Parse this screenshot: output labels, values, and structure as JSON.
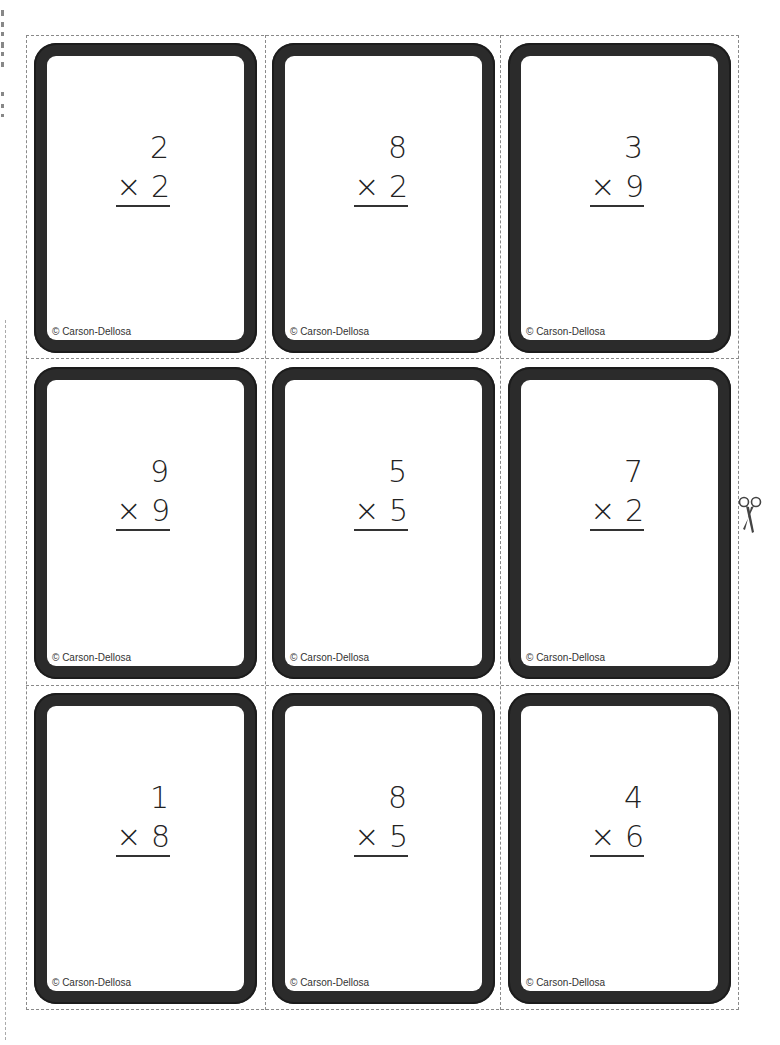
{
  "sheet": {
    "copyright": "© Carson-Dellosa",
    "cards": [
      {
        "top": "2",
        "bottom": "× 2"
      },
      {
        "top": "8",
        "bottom": "× 2"
      },
      {
        "top": "3",
        "bottom": "× 9"
      },
      {
        "top": "9",
        "bottom": "× 9"
      },
      {
        "top": "5",
        "bottom": "× 5"
      },
      {
        "top": "7",
        "bottom": "× 2"
      },
      {
        "top": "1",
        "bottom": "× 8"
      },
      {
        "top": "8",
        "bottom": "× 5"
      },
      {
        "top": "4",
        "bottom": "× 6"
      }
    ],
    "cut_icon": "scissors-icon"
  }
}
